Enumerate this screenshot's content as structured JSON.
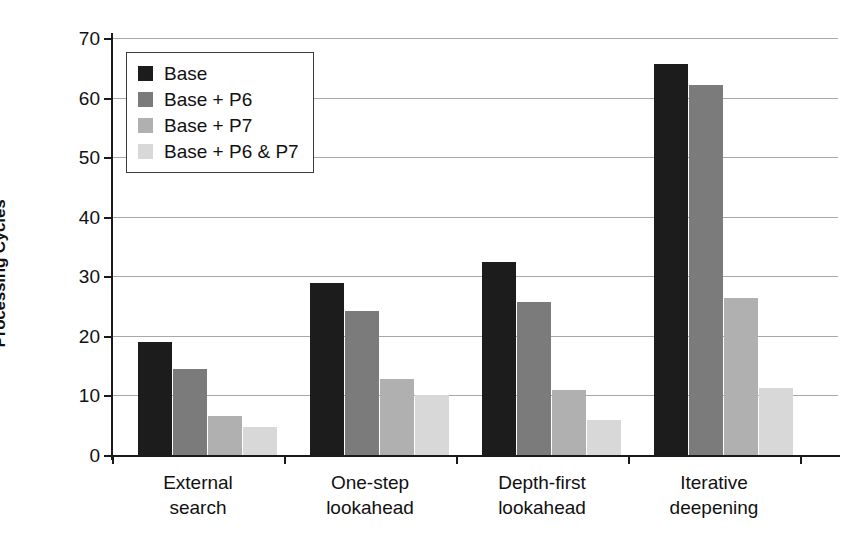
{
  "chart_data": {
    "type": "bar",
    "title": "",
    "xlabel": "",
    "ylabel": "Processing Cycles",
    "ylim": [
      0,
      70
    ],
    "yticks": [
      0,
      10,
      20,
      30,
      40,
      50,
      60,
      70
    ],
    "ytick_labels": [
      "0",
      "10",
      "20",
      "30",
      "40",
      "50",
      "60",
      "70"
    ],
    "grid": "horizontal",
    "legend_position": "upper-left-inside",
    "categories": [
      "External\nsearch",
      "One-step\nlookahead",
      "Depth-first\nlookahead",
      "Iterative\ndeepening"
    ],
    "category_lines": [
      [
        "External",
        "search"
      ],
      [
        "One-step",
        "lookahead"
      ],
      [
        "Depth-first",
        "lookahead"
      ],
      [
        "Iterative",
        "deepening"
      ]
    ],
    "series": [
      {
        "name": "Base",
        "color": "#1c1c1c",
        "values": [
          18.9,
          28.9,
          32.4,
          65.7
        ]
      },
      {
        "name": "Base + P6",
        "color": "#7b7b7b",
        "values": [
          14.4,
          24.1,
          25.7,
          62.1
        ]
      },
      {
        "name": "Base + P7",
        "color": "#b0b0b0",
        "values": [
          6.5,
          12.7,
          10.9,
          26.3
        ]
      },
      {
        "name": "Base + P6 & P7",
        "color": "#d8d8d8",
        "values": [
          4.7,
          10.0,
          5.9,
          11.2
        ]
      }
    ]
  },
  "legend": {
    "items": [
      {
        "label": "Base"
      },
      {
        "label": "Base + P6"
      },
      {
        "label": "Base + P7"
      },
      {
        "label": "Base + P6 & P7"
      }
    ]
  },
  "colors": {
    "series_base": "#1c1c1c",
    "series_p6": "#7b7b7b",
    "series_p7": "#b0b0b0",
    "series_p6p7": "#d8d8d8",
    "axis": "#1a1a1a",
    "gridline": "#a8a8a8",
    "background": "#ffffff"
  }
}
